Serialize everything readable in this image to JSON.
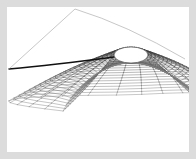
{
  "figure": {
    "title": "3D parametric wireframe surface",
    "kind": "wireframe-mesh-surface",
    "panel": {
      "background_color": "#ffffff",
      "margin_color": "#dcdcdc",
      "width": 182,
      "height": 145,
      "offset_x": 7,
      "offset_y": 7
    },
    "style": {
      "line_color": "#2b2b2b",
      "line_color_light": "#9a9a9a",
      "spine_color": "#111111",
      "line_width": 0.45,
      "spine_width": 1.4
    },
    "geometry": {
      "hole": {
        "cx": 124,
        "cy": 48,
        "rx": 17,
        "ry": 8
      },
      "apex_top": {
        "x": 68,
        "y": 2
      },
      "left_tip": {
        "x": 2,
        "y": 62
      },
      "right_tip": {
        "x": 178,
        "y": 52
      },
      "fan_bottom_y": 140,
      "u_steps": 46,
      "v_steps": 22
    },
    "chart_data": {
      "type": "wireframe",
      "title": "3D parametric wireframe surface",
      "xlabel": "",
      "ylabel": "",
      "grid": false,
      "legend": "none",
      "u_range": [
        0,
        6.2832
      ],
      "v_range": [
        0,
        1
      ],
      "u_steps": 46,
      "v_steps": 22
    }
  }
}
